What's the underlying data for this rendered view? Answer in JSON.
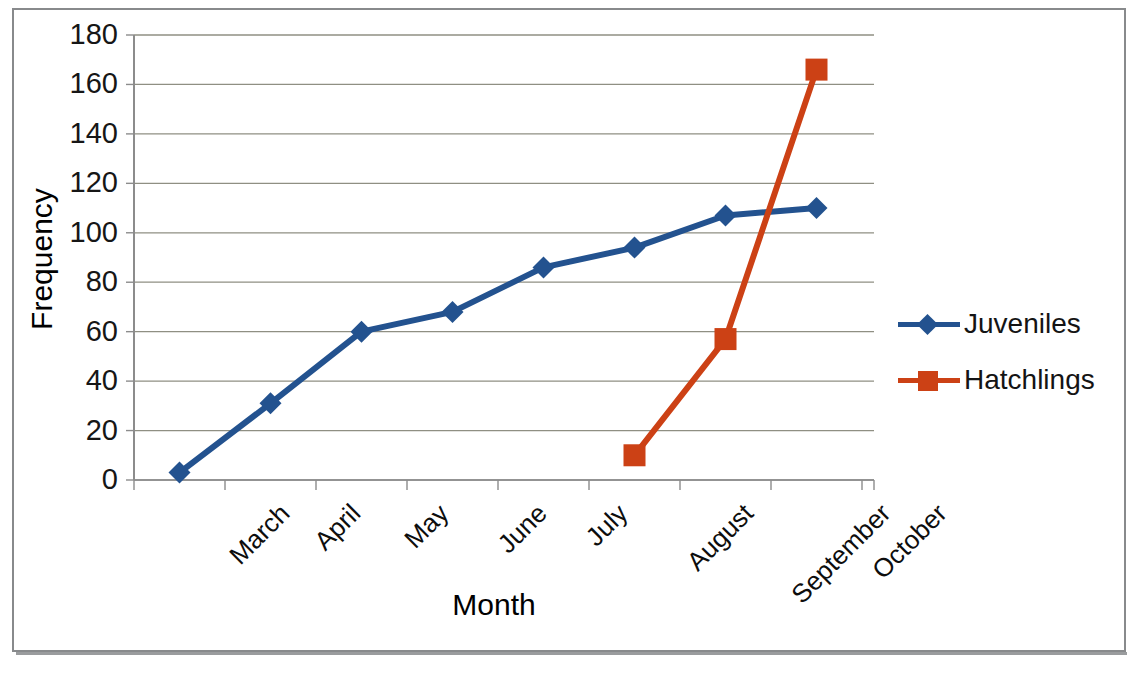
{
  "chart_data": {
    "type": "line",
    "title": "",
    "xlabel": "Month",
    "ylabel": "Frequency",
    "categories": [
      "March",
      "April",
      "May",
      "June",
      "July",
      "August",
      "September",
      "October"
    ],
    "ylim": [
      0,
      180
    ],
    "yticks": [
      0,
      20,
      40,
      60,
      80,
      100,
      120,
      140,
      160,
      180
    ],
    "grid": true,
    "legend_position": "right",
    "series": [
      {
        "name": "Juveniles",
        "color": "#23528F",
        "marker": "diamond",
        "values": [
          3,
          31,
          60,
          68,
          86,
          94,
          107,
          110
        ]
      },
      {
        "name": "Hatchlings",
        "color": "#CC4115",
        "marker": "square",
        "values": [
          null,
          null,
          null,
          null,
          null,
          10,
          57,
          166
        ]
      }
    ]
  },
  "axes": {
    "y_title": "Frequency",
    "x_title": "Month",
    "y_tick_labels": [
      "180",
      "160",
      "140",
      "120",
      "100",
      "80",
      "60",
      "40",
      "20",
      "0"
    ],
    "x_tick_labels": [
      "March",
      "April",
      "May",
      "June",
      "July",
      "August",
      "September",
      "October"
    ]
  },
  "legend": {
    "items": [
      {
        "label": "Juveniles",
        "color": "#23528F",
        "marker": "diamond"
      },
      {
        "label": "Hatchlings",
        "color": "#CC4115",
        "marker": "square"
      }
    ]
  },
  "colors": {
    "juveniles": "#23528F",
    "hatchlings": "#CC4115",
    "gridline": "#8f8f83",
    "axis": "#8c8c8c",
    "frame": "#888a8c",
    "text": "#101010"
  }
}
